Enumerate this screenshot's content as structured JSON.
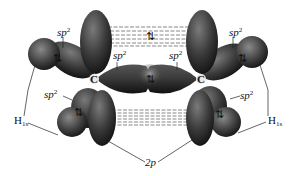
{
  "diagram": {
    "atoms": [
      {
        "id": "c-left",
        "symbol": "C"
      },
      {
        "id": "c-right",
        "symbol": "C"
      }
    ],
    "labels": {
      "sp2_upper_left": {
        "base": "sp",
        "sup": "2"
      },
      "sp2_center_left": {
        "base": "sp",
        "sup": "2"
      },
      "sp2_center_right": {
        "base": "sp",
        "sup": "2"
      },
      "sp2_upper_right": {
        "base": "sp",
        "sup": "2"
      },
      "sp2_lower_left": {
        "base": "sp",
        "sup": "2"
      },
      "sp2_lower_right": {
        "base": "sp",
        "sup": "2"
      },
      "h1s_left": {
        "base": "H",
        "sub": "1s"
      },
      "h1s_right": {
        "base": "H",
        "sub": "1s"
      },
      "p2": {
        "text": "2p"
      }
    },
    "electron_pair_symbol": "⇅",
    "colors": {
      "orbital_dark": "#1a1a1a",
      "orbital_mid": "#4a4a4a",
      "orbital_light": "#8a8a8a",
      "dash_line": "#555555",
      "background": "#ffffff"
    }
  }
}
